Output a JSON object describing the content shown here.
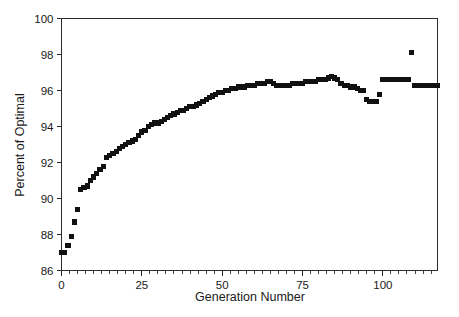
{
  "chart_data": {
    "type": "scatter",
    "title": "",
    "xlabel": "Generation Number",
    "ylabel": "Percent of Optimal",
    "xlim": [
      0,
      117
    ],
    "ylim": [
      86,
      100
    ],
    "xticks": [
      0,
      25,
      50,
      75,
      100
    ],
    "xticklabels": [
      "0",
      "25",
      "50",
      "75",
      "100"
    ],
    "yticks": [
      86,
      88,
      90,
      92,
      94,
      96,
      98,
      100
    ],
    "yticklabels": [
      "86",
      "88",
      "90",
      "92",
      "94",
      "96",
      "98",
      "100"
    ],
    "x_minor_tick_interval": 2.5,
    "grid": false,
    "legend": false,
    "marker_style": "filled-square",
    "marker_color": "#111111",
    "series": [
      {
        "name": "Percent of Optimal",
        "x": [
          0,
          1,
          2,
          3,
          4,
          5,
          6,
          7,
          8,
          9,
          10,
          11,
          12,
          13,
          14,
          15,
          16,
          17,
          18,
          19,
          20,
          21,
          22,
          23,
          24,
          25,
          26,
          27,
          28,
          29,
          30,
          31,
          32,
          33,
          34,
          35,
          36,
          37,
          38,
          39,
          40,
          41,
          42,
          43,
          44,
          45,
          46,
          47,
          48,
          49,
          50,
          51,
          52,
          53,
          54,
          55,
          56,
          57,
          58,
          59,
          60,
          61,
          62,
          63,
          64,
          65,
          66,
          67,
          68,
          69,
          70,
          71,
          72,
          73,
          74,
          75,
          76,
          77,
          78,
          79,
          80,
          81,
          82,
          83,
          84,
          85,
          86,
          87,
          88,
          89,
          90,
          91,
          92,
          93,
          94,
          95,
          96,
          97,
          98,
          99,
          100,
          101,
          102,
          103,
          104,
          105,
          106,
          107,
          108,
          109,
          110,
          111,
          112,
          113,
          114,
          115,
          116,
          117
        ],
        "y": [
          87.0,
          87.0,
          87.4,
          87.9,
          88.7,
          89.4,
          90.5,
          90.6,
          90.7,
          91.0,
          91.2,
          91.4,
          91.6,
          91.8,
          92.3,
          92.4,
          92.5,
          92.6,
          92.8,
          92.9,
          93.0,
          93.1,
          93.2,
          93.3,
          93.5,
          93.7,
          93.8,
          94.0,
          94.1,
          94.2,
          94.2,
          94.3,
          94.4,
          94.5,
          94.6,
          94.7,
          94.8,
          94.9,
          94.9,
          95.0,
          95.1,
          95.1,
          95.2,
          95.3,
          95.4,
          95.5,
          95.6,
          95.7,
          95.8,
          95.9,
          95.9,
          96.0,
          96.0,
          96.1,
          96.1,
          96.2,
          96.2,
          96.2,
          96.3,
          96.3,
          96.3,
          96.4,
          96.4,
          96.4,
          96.5,
          96.5,
          96.4,
          96.3,
          96.3,
          96.3,
          96.3,
          96.3,
          96.4,
          96.4,
          96.4,
          96.4,
          96.5,
          96.5,
          96.5,
          96.5,
          96.6,
          96.6,
          96.6,
          96.7,
          96.8,
          96.7,
          96.6,
          96.4,
          96.3,
          96.3,
          96.2,
          96.2,
          96.1,
          96.0,
          96.0,
          95.5,
          95.4,
          95.4,
          95.4,
          95.8,
          96.6,
          96.6,
          96.6,
          96.6,
          96.6,
          96.6,
          96.6,
          96.6,
          96.6,
          98.1,
          96.3,
          96.3,
          96.3,
          96.3,
          96.3,
          96.3,
          96.3,
          96.3
        ]
      }
    ]
  }
}
